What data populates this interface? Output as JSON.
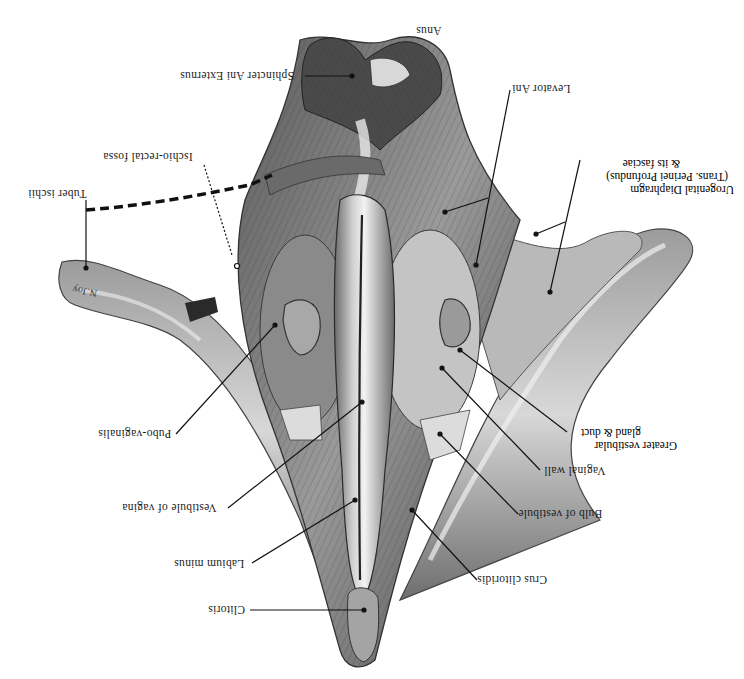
{
  "figure": {
    "orientation": "rotated-180",
    "style": "grayscale anatomical engraving"
  },
  "labels": {
    "anus": "Anus",
    "sphincter_ani_externus": "Sphincter Ani Externus",
    "levator_ani": "Levator Ani",
    "ischio_rectal_fossa": "Ischio-rectal fossa",
    "tuber_ischii": "Tuber ischii",
    "urogenital_diaphragm_line1": "Urogenital Diaphragm",
    "urogenital_diaphragm_line2": "(Trans. Perinei Profundus)",
    "urogenital_diaphragm_line3": "& its fasciae",
    "pubo_vaginalis": "Pubo-vaginalis",
    "greater_vestibular_line1": "Greater vestibular",
    "greater_vestibular_line2": "gland & duct",
    "vaginal_wall": "Vaginal wall",
    "vestibule_of_vagina": "Vestibule of vagina",
    "bulb_of_vestibule": "Bulb of vestibule",
    "labium_minus": "Labium minus",
    "crus_clitoridis": "Crus clitoridis",
    "clitoris": "Clitoris",
    "bone_signature": "N.Joy"
  },
  "colors": {
    "ink": "#1a1a1a",
    "tissue_dark": "#3a3a3a",
    "tissue_mid": "#7a7a7a",
    "tissue_light": "#bdbdbd",
    "tissue_pale": "#e4e4e4",
    "background": "#ffffff"
  }
}
